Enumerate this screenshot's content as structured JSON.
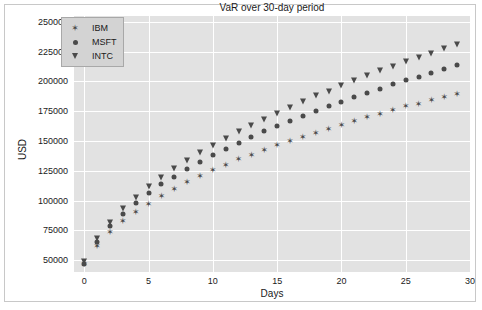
{
  "chart_data": {
    "type": "scatter",
    "title": "VaR over 30-day period",
    "xlabel": "Days",
    "ylabel": "USD",
    "xlim": [
      -0.8,
      30
    ],
    "ylim": [
      40000,
      255000
    ],
    "xticks": [
      0,
      5,
      10,
      15,
      20,
      25,
      30
    ],
    "yticks": [
      50000,
      75000,
      100000,
      125000,
      150000,
      175000,
      200000,
      225000,
      250000
    ],
    "grid": true,
    "legend_position": "upper left",
    "x": [
      0,
      1,
      2,
      3,
      4,
      5,
      6,
      7,
      8,
      9,
      10,
      11,
      12,
      13,
      14,
      15,
      16,
      17,
      18,
      19,
      20,
      21,
      22,
      23,
      24,
      25,
      26,
      27,
      28,
      29
    ],
    "series": [
      {
        "name": "IBM",
        "marker": "star",
        "color": "#4a4a4a",
        "values": [
          46500,
          62000,
          73500,
          82500,
          90500,
          97500,
          104000,
          110000,
          115500,
          120500,
          125500,
          130000,
          134500,
          138500,
          142500,
          146500,
          150000,
          153500,
          157000,
          160500,
          163500,
          167000,
          170000,
          173000,
          176000,
          179000,
          181500,
          184500,
          187000,
          189500
        ]
      },
      {
        "name": "MSFT",
        "marker": "circle",
        "color": "#4a4a4a",
        "values": [
          47000,
          65500,
          78500,
          89000,
          98000,
          106000,
          113500,
          120000,
          126500,
          132500,
          138000,
          143500,
          148500,
          153500,
          158000,
          162500,
          167000,
          171000,
          175500,
          179500,
          183000,
          187000,
          190500,
          194000,
          197500,
          201000,
          204000,
          207500,
          210500,
          213500
        ]
      },
      {
        "name": "INTC",
        "marker": "triangle-down",
        "color": "#4a4a4a",
        "values": [
          48000,
          67500,
          81500,
          92500,
          102500,
          111000,
          119000,
          126500,
          133500,
          140000,
          146000,
          152000,
          157500,
          163000,
          168000,
          173000,
          178000,
          182500,
          187500,
          191500,
          196000,
          200500,
          204500,
          208500,
          212500,
          216500,
          220000,
          223500,
          227000,
          230500
        ]
      }
    ],
    "series_offsets_note": "IBM markers render slightly above MSFT and below INTC",
    "colors": {
      "plot_background": "#e2e2e2",
      "grid": "#ffffff",
      "figure_background": "#ffffff",
      "marker": "#4a4a4a",
      "legend_background": "#d3d3d3",
      "legend_border": "#a8a8a8",
      "text": "#1a1a1a"
    }
  },
  "legend": {
    "items": [
      {
        "label": "IBM",
        "marker": "star-icon"
      },
      {
        "label": "MSFT",
        "marker": "circle-icon"
      },
      {
        "label": "INTC",
        "marker": "triangle-down-icon"
      }
    ]
  }
}
